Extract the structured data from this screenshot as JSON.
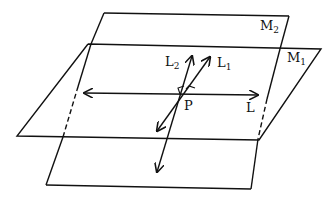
{
  "diagram": {
    "planes": [
      {
        "id": "M2",
        "label": "M",
        "subscript": "2"
      },
      {
        "id": "M1",
        "label": "M",
        "subscript": "1"
      }
    ],
    "lines": [
      {
        "id": "L",
        "label": "L",
        "subscript": ""
      },
      {
        "id": "L1",
        "label": "L",
        "subscript": "1"
      },
      {
        "id": "L2",
        "label": "L",
        "subscript": "2"
      }
    ],
    "point": {
      "label": "P"
    },
    "colors": {
      "stroke": "#111111",
      "background": "#ffffff"
    }
  }
}
